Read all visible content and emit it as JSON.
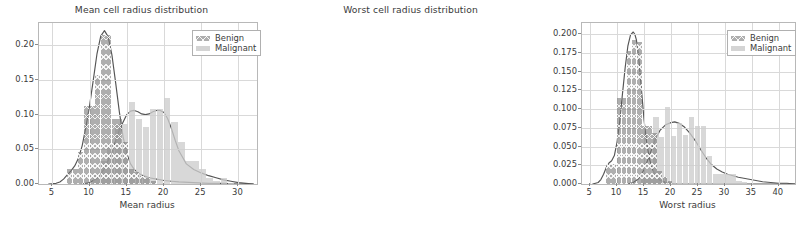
{
  "figure": {
    "background": "#ffffff",
    "benign_color": "#7d7d7d",
    "malignant_color": "#cdcdcd",
    "kde_line_color": "#555555"
  },
  "chart_data": [
    {
      "type": "histogram",
      "panel": "left",
      "title": "Mean cell radius distribution",
      "xlabel": "Mean radius",
      "ylabel": "",
      "xlim": [
        3.2,
        32.5
      ],
      "ylim": [
        0.0,
        0.232
      ],
      "grid": true,
      "legend_position": "upper right",
      "xticks": [
        5,
        10,
        15,
        20,
        25,
        30
      ],
      "xticklabels": [
        "5",
        "10",
        "15",
        "20",
        "25",
        "30"
      ],
      "yticks": [
        0.0,
        0.05,
        0.1,
        0.15,
        0.2
      ],
      "yticklabels": [
        "0.00",
        "0.05",
        "0.10",
        "0.15",
        "0.20"
      ],
      "series": [
        {
          "name": "Benign",
          "color": "#7d7d7d",
          "hatch": "xx",
          "bin_width": 0.75,
          "bins": [
            7.0,
            7.75,
            8.5,
            9.25,
            10.0,
            10.75,
            11.5,
            12.25,
            13.0,
            13.75,
            14.5,
            15.25,
            16.0,
            16.75,
            17.5,
            18.25
          ],
          "densities": [
            0.022,
            0.022,
            0.046,
            0.113,
            0.113,
            0.157,
            0.215,
            0.215,
            0.093,
            0.093,
            0.06,
            0.022,
            0.018,
            0.012,
            0.008,
            0.004
          ]
        },
        {
          "name": "Malignant",
          "color": "#cdcdcd",
          "hatch": "",
          "bin_width": 0.95,
          "bins": [
            10.5,
            11.45,
            12.4,
            13.35,
            14.3,
            15.25,
            16.2,
            17.15,
            18.1,
            19.05,
            20.0,
            20.95,
            21.9,
            22.85,
            23.8,
            24.75,
            25.7,
            26.65,
            27.6,
            28.55
          ],
          "densities": [
            0.013,
            0.033,
            0.058,
            0.086,
            0.086,
            0.118,
            0.093,
            0.082,
            0.108,
            0.108,
            0.124,
            0.089,
            0.06,
            0.033,
            0.033,
            0.022,
            0.009,
            0.005,
            0.009,
            0.002
          ]
        }
      ],
      "kde_curves": [
        {
          "name": "Benign KDE",
          "x": [
            4.5,
            5.5,
            6.0,
            6.5,
            7.0,
            7.5,
            8.0,
            8.5,
            9.0,
            9.5,
            10.0,
            10.5,
            11.0,
            11.5,
            12.0,
            12.5,
            13.0,
            13.5,
            14.0,
            14.5,
            15.0,
            15.5,
            16.0,
            16.5,
            17.0,
            17.5,
            18.0,
            19.0,
            20.0,
            21.0,
            22.0,
            24.0,
            26.0,
            28.0,
            30.0,
            32.0
          ],
          "y": [
            0.0,
            0.001,
            0.003,
            0.007,
            0.013,
            0.019,
            0.026,
            0.037,
            0.055,
            0.082,
            0.113,
            0.15,
            0.188,
            0.213,
            0.221,
            0.212,
            0.186,
            0.146,
            0.104,
            0.068,
            0.044,
            0.029,
            0.021,
            0.016,
            0.013,
            0.011,
            0.009,
            0.007,
            0.005,
            0.004,
            0.003,
            0.002,
            0.001,
            0.001,
            0.0,
            0.0
          ]
        },
        {
          "name": "Malignant KDE",
          "x": [
            9.0,
            10.0,
            11.0,
            12.0,
            13.0,
            14.0,
            15.0,
            15.5,
            16.0,
            16.5,
            17.0,
            17.5,
            18.0,
            18.5,
            19.0,
            19.5,
            20.0,
            20.5,
            21.0,
            21.5,
            22.0,
            23.0,
            24.0,
            25.0,
            26.0,
            27.0,
            28.0,
            29.0,
            30.0,
            31.0,
            32.0
          ],
          "y": [
            0.0,
            0.002,
            0.008,
            0.022,
            0.046,
            0.078,
            0.1,
            0.105,
            0.106,
            0.104,
            0.101,
            0.1,
            0.101,
            0.104,
            0.106,
            0.106,
            0.103,
            0.094,
            0.08,
            0.063,
            0.048,
            0.029,
            0.021,
            0.016,
            0.012,
            0.009,
            0.006,
            0.004,
            0.002,
            0.001,
            0.0
          ]
        }
      ],
      "legend": [
        "Benign",
        "Malignant"
      ]
    },
    {
      "type": "histogram",
      "panel": "right",
      "title": "Worst cell radius distribution",
      "xlabel": "Worst radius",
      "ylabel": "",
      "xlim": [
        3.5,
        43.0
      ],
      "ylim": [
        0.0,
        0.215
      ],
      "grid": true,
      "legend_position": "upper right",
      "xticks": [
        5,
        10,
        15,
        20,
        25,
        30,
        35,
        40
      ],
      "xticklabels": [
        "5",
        "10",
        "15",
        "20",
        "25",
        "30",
        "35",
        "40"
      ],
      "yticks": [
        0.0,
        0.025,
        0.05,
        0.075,
        0.1,
        0.125,
        0.15,
        0.175,
        0.2
      ],
      "yticklabels": [
        "0.000",
        "0.025",
        "0.050",
        "0.075",
        "0.100",
        "0.125",
        "0.150",
        "0.175",
        "0.200"
      ],
      "series": [
        {
          "name": "Benign",
          "color": "#7d7d7d",
          "hatch": "xx",
          "bin_width": 0.95,
          "bins": [
            8.0,
            8.95,
            9.9,
            10.85,
            11.8,
            12.75,
            13.7,
            14.65,
            15.6,
            16.55,
            17.5,
            18.45,
            19.4
          ],
          "densities": [
            0.027,
            0.027,
            0.115,
            0.115,
            0.178,
            0.192,
            0.19,
            0.077,
            0.077,
            0.068,
            0.018,
            0.01,
            0.004
          ]
        },
        {
          "name": "Malignant",
          "color": "#cdcdcd",
          "hatch": "",
          "bin_width": 1.1,
          "bins": [
            14.5,
            15.6,
            16.7,
            17.8,
            18.9,
            20.0,
            21.1,
            22.2,
            23.3,
            24.4,
            25.5,
            26.6,
            27.7,
            28.8,
            29.9,
            31.0,
            32.1,
            33.2
          ],
          "densities": [
            0.009,
            0.014,
            0.09,
            0.063,
            0.103,
            0.064,
            0.082,
            0.066,
            0.09,
            0.077,
            0.078,
            0.037,
            0.013,
            0.013,
            0.013,
            0.014,
            0.004,
            0.003
          ]
        }
      ],
      "kde_curves": [
        {
          "name": "Benign KDE",
          "x": [
            5.5,
            6.5,
            7.0,
            7.5,
            8.0,
            8.5,
            9.0,
            9.5,
            10.0,
            10.5,
            11.0,
            11.5,
            12.0,
            12.5,
            13.0,
            13.3,
            13.6,
            14.0,
            14.5,
            15.0,
            15.5,
            16.0,
            16.5,
            17.0,
            17.5,
            18.0,
            19.0,
            20.0,
            21.0,
            22.0,
            24.0,
            26.0,
            30.0,
            35.0,
            40.0,
            43.0
          ],
          "y": [
            0.0,
            0.002,
            0.006,
            0.013,
            0.022,
            0.028,
            0.031,
            0.038,
            0.056,
            0.084,
            0.12,
            0.155,
            0.184,
            0.199,
            0.203,
            0.2,
            0.192,
            0.17,
            0.128,
            0.086,
            0.055,
            0.034,
            0.021,
            0.013,
            0.008,
            0.005,
            0.002,
            0.001,
            0.0,
            0.0,
            0.0,
            0.0,
            0.0,
            0.0,
            0.0,
            0.0
          ]
        },
        {
          "name": "Malignant KDE",
          "x": [
            12.0,
            13.0,
            14.0,
            15.0,
            16.0,
            17.0,
            18.0,
            19.0,
            20.0,
            20.7,
            21.5,
            22.5,
            23.5,
            24.5,
            25.5,
            26.5,
            27.5,
            28.5,
            29.5,
            30.5,
            31.5,
            32.5,
            34.0,
            35.5,
            37.0,
            38.5,
            40.0,
            41.5,
            43.0
          ],
          "y": [
            0.0,
            0.002,
            0.007,
            0.019,
            0.038,
            0.058,
            0.072,
            0.079,
            0.082,
            0.083,
            0.081,
            0.076,
            0.068,
            0.058,
            0.046,
            0.035,
            0.026,
            0.02,
            0.016,
            0.013,
            0.011,
            0.009,
            0.007,
            0.005,
            0.003,
            0.002,
            0.001,
            0.001,
            0.0
          ]
        }
      ],
      "legend": [
        "Benign",
        "Malignant"
      ]
    }
  ]
}
